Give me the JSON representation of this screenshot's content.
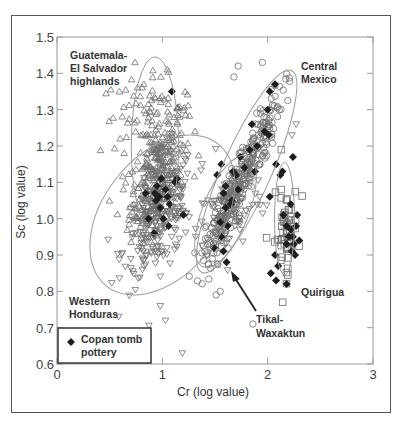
{
  "chart_data": {
    "type": "scatter",
    "title": "",
    "xlabel": "Cr (log value)",
    "ylabel": "Sc (log value)",
    "xlim": [
      0,
      3
    ],
    "ylim": [
      0.6,
      1.5
    ],
    "xticks": [
      "0",
      "1",
      "2",
      "3"
    ],
    "yticks": [
      "0.6",
      "0.7",
      "0.8",
      "0.9",
      "1.0",
      "1.1",
      "1.2",
      "1.3",
      "1.4",
      "1.5"
    ],
    "grid": false,
    "legend": {
      "position": "lower-left",
      "entries": [
        {
          "marker": "filled-diamond",
          "label_line1": "Copan tomb",
          "label_line2": "pottery"
        }
      ]
    },
    "groups": [
      {
        "name": "Guatemala-El Salvador highlands",
        "marker": "open-triangle-up",
        "label_lines": [
          "Guatemala-",
          "El Salvador",
          "highlands"
        ],
        "ellipse": {
          "cx": 0.93,
          "cy": 1.2,
          "rx": 0.45,
          "ry": 0.245,
          "angle": 0
        },
        "clusters": [
          {
            "cx": 0.95,
            "cy": 1.13,
            "sx": 0.13,
            "sy": 0.085,
            "rho": 0.55,
            "n": 260
          },
          {
            "cx": 0.85,
            "cy": 1.29,
            "sx": 0.22,
            "sy": 0.05,
            "rho": 0.1,
            "n": 70
          }
        ]
      },
      {
        "name": "Western Honduras",
        "marker": "open-triangle-down",
        "label_lines": [
          "Western",
          "Honduras"
        ],
        "ellipse": {
          "cx": 1.0,
          "cy": 1.01,
          "rx": 0.56,
          "ry": 0.18,
          "angle": 52
        },
        "clusters": [
          {
            "cx": 0.97,
            "cy": 1.0,
            "sx": 0.17,
            "sy": 0.08,
            "rho": 0.55,
            "n": 240
          },
          {
            "cx": 1.65,
            "cy": 1.02,
            "sx": 0.16,
            "sy": 0.06,
            "rho": 0.4,
            "n": 90
          }
        ]
      },
      {
        "name": "Central Mexico",
        "marker": "open-circle",
        "label_lines": [
          "Central",
          "Mexico"
        ],
        "ellipse": {
          "cx": 1.8,
          "cy": 1.13,
          "rx": 0.6,
          "ry": 0.075,
          "angle": 66
        },
        "clusters": [
          {
            "cx": 1.78,
            "cy": 1.13,
            "sx": 0.18,
            "sy": 0.11,
            "rho": 0.93,
            "n": 230
          }
        ]
      },
      {
        "name": "Tikal-Waxaktun",
        "marker": "open-circle",
        "label_lines": [
          "Tikal-",
          "Waxaktun"
        ],
        "ellipse": {
          "cx": 1.6,
          "cy": 1.02,
          "rx": 0.32,
          "ry": 0.07,
          "angle": 68
        },
        "clusters": [
          {
            "cx": 1.58,
            "cy": 1.0,
            "sx": 0.09,
            "sy": 0.07,
            "rho": 0.8,
            "n": 70
          }
        ]
      },
      {
        "name": "Quirigua",
        "marker": "open-square",
        "label_lines": [
          "Quirigua"
        ],
        "ellipse": {
          "cx": 2.16,
          "cy": 1.0,
          "rx": 0.19,
          "ry": 0.155,
          "angle": 0
        },
        "clusters": [
          {
            "cx": 2.17,
            "cy": 0.96,
            "sx": 0.06,
            "sy": 0.06,
            "rho": 0.2,
            "n": 55
          }
        ]
      }
    ],
    "copan_tomb_pottery": [
      [
        1.09,
        1.35
      ],
      [
        0.94,
        1.05
      ],
      [
        0.98,
        1.03
      ],
      [
        0.87,
        1.0
      ],
      [
        1.01,
        1.0
      ],
      [
        0.93,
        1.07
      ],
      [
        0.95,
        1.09
      ],
      [
        0.84,
        1.07
      ],
      [
        1.12,
        1.1
      ],
      [
        1.14,
        1.11
      ],
      [
        1.05,
        1.06
      ],
      [
        1.07,
        1.04
      ],
      [
        0.92,
        0.96
      ],
      [
        1.2,
        1.01
      ],
      [
        1.06,
        0.98
      ],
      [
        0.99,
        1.11
      ],
      [
        1.03,
        1.08
      ],
      [
        0.97,
        1.06
      ],
      [
        1.49,
        0.92
      ],
      [
        1.58,
        0.91
      ],
      [
        1.61,
        0.88
      ],
      [
        1.56,
        0.95
      ],
      [
        1.55,
        0.99
      ],
      [
        1.62,
        0.98
      ],
      [
        1.6,
        1.03
      ],
      [
        1.66,
        1.05
      ],
      [
        1.6,
        1.09
      ],
      [
        1.52,
        1.12
      ],
      [
        1.58,
        1.07
      ],
      [
        1.56,
        1.15
      ],
      [
        1.7,
        1.12
      ],
      [
        1.74,
        1.17
      ],
      [
        1.83,
        1.19
      ],
      [
        1.67,
        1.13
      ],
      [
        1.9,
        1.2
      ],
      [
        1.65,
        1.04
      ],
      [
        1.72,
        1.08
      ],
      [
        1.78,
        1.14
      ],
      [
        1.88,
        1.13
      ],
      [
        1.85,
        1.26
      ],
      [
        1.97,
        1.24
      ],
      [
        2.01,
        1.23
      ],
      [
        2.0,
        1.3
      ],
      [
        2.02,
        1.35
      ],
      [
        2.07,
        1.37
      ],
      [
        2.08,
        1.15
      ],
      [
        2.12,
        1.12
      ],
      [
        2.14,
        1.13
      ],
      [
        2.02,
        1.06
      ],
      [
        2.15,
        1.01
      ],
      [
        2.18,
        0.98
      ],
      [
        2.22,
        0.97
      ],
      [
        2.2,
        0.95
      ],
      [
        2.25,
        0.93
      ],
      [
        2.23,
        0.91
      ],
      [
        2.28,
        1.01
      ],
      [
        2.27,
        0.98
      ],
      [
        2.24,
        0.95
      ],
      [
        2.26,
        0.9
      ],
      [
        2.07,
        0.9
      ],
      [
        2.1,
        0.87
      ],
      [
        2.03,
        0.85
      ],
      [
        2.08,
        0.83
      ],
      [
        2.18,
        0.82
      ],
      [
        2.3,
        0.94
      ],
      [
        2.22,
        1.04
      ],
      [
        2.18,
        0.93
      ],
      [
        2.24,
        1.17
      ]
    ],
    "outliers": [
      {
        "marker": "open-triangle-up",
        "x": 0.63,
        "y": 1.08
      },
      {
        "marker": "open-triangle-up",
        "x": 0.74,
        "y": 1.43
      },
      {
        "marker": "open-triangle-up",
        "x": 0.6,
        "y": 1.22
      },
      {
        "marker": "open-triangle-down",
        "x": 1.03,
        "y": 0.72
      },
      {
        "marker": "open-triangle-down",
        "x": 1.19,
        "y": 0.63
      },
      {
        "marker": "open-triangle-down",
        "x": 0.98,
        "y": 0.76
      },
      {
        "marker": "open-circle",
        "x": 1.72,
        "y": 1.42
      },
      {
        "marker": "open-circle",
        "x": 1.68,
        "y": 1.39
      },
      {
        "marker": "open-circle",
        "x": 1.95,
        "y": 1.43
      },
      {
        "marker": "open-circle",
        "x": 1.51,
        "y": 0.79
      },
      {
        "marker": "open-circle",
        "x": 1.55,
        "y": 0.8
      },
      {
        "marker": "open-circle",
        "x": 1.86,
        "y": 0.71
      },
      {
        "marker": "open-square",
        "x": 2.13,
        "y": 1.19
      },
      {
        "marker": "open-triangle-down",
        "x": 2.23,
        "y": 1.23
      },
      {
        "marker": "open-triangle-down",
        "x": 2.27,
        "y": 1.26
      }
    ],
    "annotations": [
      {
        "text": "Tikal-Waxaktun",
        "arrow_from": [
          1.83,
          0.71
        ],
        "arrow_to": [
          1.6,
          0.86
        ]
      }
    ]
  },
  "labels": {
    "guatemala": [
      "Guatemala-",
      "El Salvador",
      "highlands"
    ],
    "central_mexico": [
      "Central",
      "Mexico"
    ],
    "western_honduras": [
      "Western",
      "Honduras"
    ],
    "tikal": [
      "Tikal-",
      "Waxaktun"
    ],
    "quirigua": "Quirigua",
    "legend": [
      "Copan tomb",
      "pottery"
    ],
    "xlabel": "Cr (log value)",
    "ylabel": "Sc (log value)"
  },
  "colors": {
    "axis": "#9a9a9a",
    "marker_stroke": "#6e6e6e",
    "diamond_fill": "#1e1e1e",
    "ellipse": "#9a9a9a",
    "text": "#333333",
    "legend_border": "#333333"
  }
}
